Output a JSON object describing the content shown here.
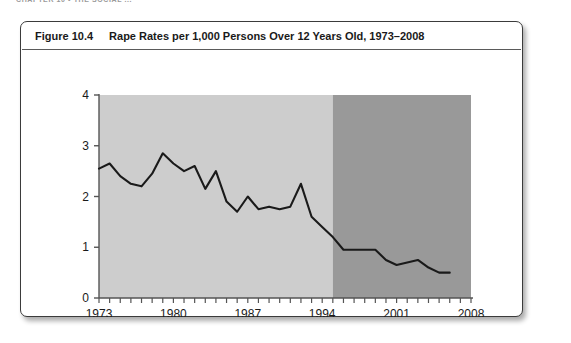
{
  "running_head": "CHAPTER 10  •  THE SOCIAL ...",
  "figure": {
    "number_label": "Figure 10.4",
    "caption": "Rape Rates per 1,000 Persons Over 12 Years Old, 1973–2008"
  },
  "colors": {
    "band_light": "#cdcdcd",
    "band_dark": "#999999",
    "line": "#1a1a1a",
    "axis": "#555555",
    "box_border": "#3b3b3b",
    "text": "#1a1a1a",
    "page_background": "#ffffff"
  },
  "chart_data": {
    "type": "line",
    "title": "Rape Rates per 1,000 Persons Over 12 Years Old, 1973–2008",
    "xlabel": "",
    "ylabel": "",
    "xlim": [
      1973,
      2008
    ],
    "ylim": [
      0,
      4
    ],
    "ytick_labels": [
      "0",
      "1",
      "2",
      "3",
      "4"
    ],
    "yticks": [
      0,
      1,
      2,
      3,
      4
    ],
    "xtick_labels": [
      "1973",
      "1980",
      "1987",
      "1994",
      "2001",
      "2008"
    ],
    "xticks": [
      1973,
      1980,
      1987,
      1994,
      2001,
      2008
    ],
    "minor_xticks_every_year": true,
    "grid": false,
    "legend": null,
    "x": [
      1973,
      1974,
      1975,
      1976,
      1977,
      1978,
      1979,
      1980,
      1981,
      1982,
      1983,
      1984,
      1985,
      1986,
      1987,
      1988,
      1989,
      1990,
      1991,
      1992,
      1993,
      1994,
      1995,
      1996,
      1997,
      1998,
      1999,
      2000,
      2001,
      2002,
      2003,
      2004,
      2005,
      2006,
      2007,
      2008
    ],
    "values": [
      2.55,
      2.65,
      2.4,
      2.25,
      2.2,
      2.45,
      2.85,
      2.65,
      2.5,
      2.6,
      2.15,
      2.5,
      1.9,
      1.7,
      2.0,
      1.75,
      1.8,
      1.75,
      1.8,
      2.25,
      1.6,
      1.4,
      1.2,
      0.95,
      0.95,
      0.95,
      0.95,
      0.75,
      0.65,
      0.7,
      0.75,
      0.6,
      0.5,
      0.5,
      null,
      0.8
    ],
    "series": [
      {
        "name": "Rape rate per 1,000 persons age 12+",
        "values": [
          2.55,
          2.65,
          2.4,
          2.25,
          2.2,
          2.45,
          2.85,
          2.65,
          2.5,
          2.6,
          2.15,
          2.5,
          1.9,
          1.7,
          2.0,
          1.75,
          1.8,
          1.75,
          1.8,
          2.25,
          1.6,
          1.4,
          1.2,
          0.95,
          0.95,
          0.95,
          0.95,
          0.75,
          0.65,
          0.7,
          0.75,
          0.6,
          0.5,
          0.5,
          null,
          0.8
        ]
      }
    ],
    "shaded_bands": [
      {
        "name": "light-band",
        "x_start": 1973,
        "x_end": 1995,
        "color": "#cdcdcd"
      },
      {
        "name": "dark-band",
        "x_start": 1995,
        "x_end": 2008,
        "color": "#999999"
      }
    ],
    "annotations": []
  }
}
